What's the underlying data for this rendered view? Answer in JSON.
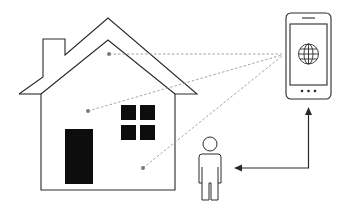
{
  "diagram": {
    "colors": {
      "stroke": "#2a2a2a",
      "fill_dark": "#0d0d0d",
      "dashed_link": "#9a9a9a",
      "sensor_dot": "#7a7a7a",
      "background": "#ffffff"
    },
    "nodes": [
      {
        "id": "house",
        "label": "House",
        "icon": "house-icon"
      },
      {
        "id": "sensor-roof",
        "label": "Sensor (attic)",
        "icon": "sensor-dot-icon"
      },
      {
        "id": "sensor-mid",
        "label": "Sensor (living area)",
        "icon": "sensor-dot-icon"
      },
      {
        "id": "sensor-low",
        "label": "Sensor (ground floor)",
        "icon": "sensor-dot-icon"
      },
      {
        "id": "phone",
        "label": "Smartphone with web app",
        "icon": "smartphone-icon",
        "screen_icon": "globe-icon"
      },
      {
        "id": "person",
        "label": "User",
        "icon": "person-icon"
      }
    ],
    "edges": [
      {
        "from": "sensor-roof",
        "to": "phone",
        "style": "dashed"
      },
      {
        "from": "sensor-mid",
        "to": "phone",
        "style": "dashed"
      },
      {
        "from": "sensor-low",
        "to": "phone",
        "style": "dashed"
      },
      {
        "from": "phone",
        "to": "person",
        "style": "solid-arrow",
        "direction": "bidirectional"
      }
    ]
  }
}
